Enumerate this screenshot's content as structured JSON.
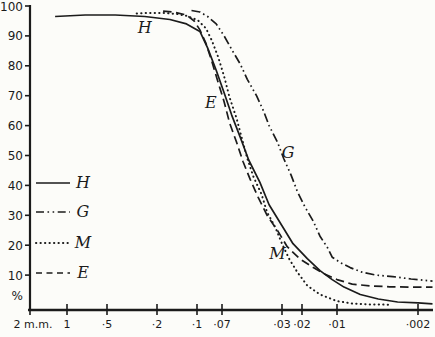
{
  "figure": {
    "kind": "scanned grading-curve line chart",
    "title": ""
  },
  "chart_data": {
    "type": "line",
    "title": "",
    "xlabel": "",
    "ylabel": "%",
    "grid": false,
    "x_axis": {
      "scale": "log-decreasing",
      "unit": "m.m.",
      "ticks": [
        {
          "label": "2 m.m.",
          "value": 2,
          "px": 30
        },
        {
          "label": "1",
          "value": 1,
          "px": 67
        },
        {
          "label": "·5",
          "value": 0.5,
          "px": 107
        },
        {
          "label": "·2",
          "value": 0.2,
          "px": 157
        },
        {
          "label": "·1",
          "value": 0.1,
          "px": 197
        },
        {
          "label": "·07",
          "value": 0.07,
          "px": 222
        },
        {
          "label": "·03",
          "value": 0.03,
          "px": 282
        },
        {
          "label": "·02",
          "value": 0.02,
          "px": 302
        },
        {
          "label": "·01",
          "value": 0.01,
          "px": 337
        },
        {
          "label": "·002",
          "value": 0.002,
          "px": 418
        }
      ]
    },
    "y_axis": {
      "min": 0,
      "max": 100,
      "unit_label": "%",
      "ticks": [
        {
          "label": "100",
          "value": 100
        },
        {
          "label": "90",
          "value": 90
        },
        {
          "label": "80",
          "value": 80
        },
        {
          "label": "70",
          "value": 70
        },
        {
          "label": "60",
          "value": 60
        },
        {
          "label": "50",
          "value": 50
        },
        {
          "label": "40",
          "value": 40
        },
        {
          "label": "30",
          "value": 30
        },
        {
          "label": "20",
          "value": 20
        },
        {
          "label": "10",
          "value": 10
        }
      ]
    },
    "legend": {
      "position": "left-inside",
      "entries": [
        {
          "label": "H",
          "style": "solid"
        },
        {
          "label": "G",
          "style": "dash-dot-dot"
        },
        {
          "label": "M",
          "style": "dotted"
        },
        {
          "label": "E",
          "style": "dashed"
        }
      ]
    },
    "series": [
      {
        "name": "H",
        "style": "solid",
        "points": [
          [
            1.25,
            96.5
          ],
          [
            0.73,
            97
          ],
          [
            0.43,
            97
          ],
          [
            0.25,
            96.5
          ],
          [
            0.16,
            95.5
          ],
          [
            0.12,
            94
          ],
          [
            0.096,
            91.5
          ],
          [
            0.086,
            86
          ],
          [
            0.076,
            78.5
          ],
          [
            0.068,
            71
          ],
          [
            0.061,
            63.5
          ],
          [
            0.054,
            56
          ],
          [
            0.048,
            48.5
          ],
          [
            0.041,
            41
          ],
          [
            0.036,
            33.5
          ],
          [
            0.03,
            26.5
          ],
          [
            0.024,
            20.5
          ],
          [
            0.018,
            15.5
          ],
          [
            0.014,
            11.5
          ],
          [
            0.011,
            8.5
          ],
          [
            0.0087,
            6
          ],
          [
            0.0063,
            3.5
          ],
          [
            0.0044,
            2
          ],
          [
            0.003,
            1
          ],
          [
            0.002,
            0.7
          ],
          [
            0.0015,
            0.4
          ]
        ]
      },
      {
        "name": "G",
        "style": "dash-dot-dot",
        "points": [
          [
            0.11,
            98.5
          ],
          [
            0.096,
            98
          ],
          [
            0.086,
            96.5
          ],
          [
            0.076,
            94
          ],
          [
            0.068,
            90
          ],
          [
            0.061,
            85.5
          ],
          [
            0.054,
            80.5
          ],
          [
            0.049,
            75.5
          ],
          [
            0.043,
            70
          ],
          [
            0.039,
            65
          ],
          [
            0.036,
            60
          ],
          [
            0.032,
            54.5
          ],
          [
            0.029,
            49
          ],
          [
            0.025,
            43.5
          ],
          [
            0.022,
            38
          ],
          [
            0.019,
            33
          ],
          [
            0.016,
            28
          ],
          [
            0.014,
            23
          ],
          [
            0.012,
            19
          ],
          [
            0.011,
            16
          ],
          [
            0.0092,
            14
          ],
          [
            0.0077,
            12.5
          ],
          [
            0.0061,
            11
          ],
          [
            0.0046,
            10
          ],
          [
            0.0033,
            9.5
          ],
          [
            0.0023,
            8.7
          ],
          [
            0.0015,
            8
          ]
        ]
      },
      {
        "name": "M",
        "style": "dotted",
        "points": [
          [
            0.29,
            97.5
          ],
          [
            0.23,
            97.7
          ],
          [
            0.18,
            97.7
          ],
          [
            0.14,
            97.3
          ],
          [
            0.12,
            96.7
          ],
          [
            0.099,
            95.3
          ],
          [
            0.088,
            92.5
          ],
          [
            0.081,
            88.5
          ],
          [
            0.074,
            83
          ],
          [
            0.068,
            76.5
          ],
          [
            0.063,
            69.5
          ],
          [
            0.057,
            62.5
          ],
          [
            0.053,
            56
          ],
          [
            0.049,
            49
          ],
          [
            0.045,
            43
          ],
          [
            0.04,
            37
          ],
          [
            0.037,
            31
          ],
          [
            0.033,
            26
          ],
          [
            0.03,
            20.5
          ],
          [
            0.026,
            15.5
          ],
          [
            0.022,
            11
          ],
          [
            0.018,
            6.5
          ],
          [
            0.014,
            3.5
          ],
          [
            0.01,
            1.3
          ],
          [
            0.0074,
            0.5
          ],
          [
            0.0052,
            0.2
          ],
          [
            0.0036,
            0.1
          ]
        ]
      },
      {
        "name": "E",
        "style": "dashed",
        "points": [
          [
            0.18,
            98.3
          ],
          [
            0.15,
            98
          ],
          [
            0.12,
            97
          ],
          [
            0.105,
            95
          ],
          [
            0.096,
            92
          ],
          [
            0.088,
            87.5
          ],
          [
            0.081,
            81.5
          ],
          [
            0.074,
            74.5
          ],
          [
            0.068,
            68
          ],
          [
            0.063,
            61
          ],
          [
            0.057,
            54.5
          ],
          [
            0.052,
            48
          ],
          [
            0.047,
            42
          ],
          [
            0.042,
            36
          ],
          [
            0.037,
            30
          ],
          [
            0.032,
            25
          ],
          [
            0.027,
            19.5
          ],
          [
            0.021,
            15.5
          ],
          [
            0.016,
            12.5
          ],
          [
            0.013,
            10.5
          ],
          [
            0.01,
            8.5
          ],
          [
            0.0074,
            7
          ],
          [
            0.0052,
            6.4
          ],
          [
            0.0035,
            6.1
          ],
          [
            0.0023,
            6
          ],
          [
            0.0015,
            6
          ]
        ]
      }
    ],
    "annotations": [
      {
        "text": "H",
        "size": 0.25,
        "percent": 92.5
      },
      {
        "text": "E",
        "size": 0.082,
        "percent": 67.5
      },
      {
        "text": "G",
        "size": 0.0265,
        "percent": 51
      },
      {
        "text": "M",
        "size": 0.032,
        "percent": 17
      }
    ],
    "colors": {
      "ink": "#1b1b1b",
      "background": "#fcfcf9"
    },
    "layout": {
      "width": 435,
      "height": 337,
      "y_scale": {
        "p100_y": 6,
        "px_per_percent": 2.99
      },
      "y_axis_x": 30,
      "y_axis_y1": 5,
      "y_axis_y2": 311,
      "x_axis_y": 310,
      "x_axis_x1": 28,
      "x_axis_x2": 433,
      "y_tick_x1": 25,
      "y_tick_x2": 31,
      "y_label_x": 23,
      "x_tick_y1": 304,
      "x_tick_y2": 315,
      "x_label_y": 328,
      "percent_label_y": 300,
      "legend": {
        "x1": 36,
        "x2": 70,
        "label_x": 77,
        "ys": [
          183,
          212,
          243,
          273
        ]
      },
      "styles": {
        "solid": "",
        "dash-dot-dot": "9 3.2 1.6 3.2 1.6 3.2",
        "dotted": "0.3 4.2",
        "dashed": "8.5 4.5"
      },
      "legend_styles": {
        "solid": "",
        "dash-dot-dot": "8 3.5 1.6 3.5 1.6 3.5",
        "dotted": "0.3 4.2",
        "dashed": "6 4.5"
      }
    }
  }
}
